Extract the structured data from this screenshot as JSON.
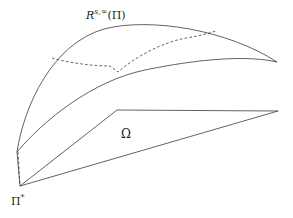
{
  "figure": {
    "background_color": "#ffffff",
    "stroke_color": "#3a3a3a",
    "labels": {
      "reachable_set": {
        "base": "R",
        "superscript": "s,∞",
        "argument": "(Π)",
        "full_text": "R^{s,∞}(Π)"
      },
      "domain": {
        "text": "Ω"
      },
      "initial_point": {
        "base": "Π",
        "superscript": "*",
        "full_text": "Π*"
      }
    },
    "geometry": {
      "apex_right": {
        "x": 277,
        "y": 62
      },
      "node_upper_left": {
        "x": 17,
        "y": 152
      },
      "node_pi_star": {
        "x": 20,
        "y": 186
      },
      "omega_corner_top_left": {
        "x": 117,
        "y": 110
      },
      "omega_corner_top_right": {
        "x": 278,
        "y": 111
      }
    }
  },
  "chart_data": {
    "type": "line",
    "xlabel": "",
    "ylabel": "",
    "xlim": [
      0,
      293
    ],
    "ylim": [
      218,
      0
    ],
    "grid": false,
    "legend": null,
    "annotations": [
      {
        "text": "R^{s,∞}(Π)",
        "x": 110,
        "y": 15
      },
      {
        "text": "Ω",
        "x": 128,
        "y": 135
      },
      {
        "text": "Π*",
        "x": 20,
        "y": 200
      }
    ],
    "series": [
      {
        "name": "upper-boundary-arc",
        "style": "solid",
        "path": "M 17 152 C 24 106 52 44 104 29 C 150 17 228 30 277 62"
      },
      {
        "name": "lower-boundary-arc",
        "style": "solid",
        "path": "M 17 152 C 44 120 92 81 145 70 C 198 59 247 55 277 62"
      },
      {
        "name": "intermediate-dashed-curve",
        "style": "dashed",
        "path": "M 52 58 C 70 63 92 66 110 66 L 118 72 C 134 58 160 43 186 38 C 200 36 209 33 216 31"
      },
      {
        "name": "vertical-dashed-connector",
        "style": "dashed",
        "path": "M 18 152 L 20 186"
      },
      {
        "name": "omega-diagonal-left",
        "style": "solid",
        "path": "M 20 186 L 117 110"
      },
      {
        "name": "omega-top-edge",
        "style": "solid",
        "path": "M 117 110 L 278 111"
      },
      {
        "name": "omega-diagonal-right",
        "style": "solid",
        "path": "M 278 111 L 20 186"
      },
      {
        "name": "left-edge-to-upper-node",
        "style": "solid",
        "path": "M 20 186 L 17 152"
      }
    ]
  }
}
